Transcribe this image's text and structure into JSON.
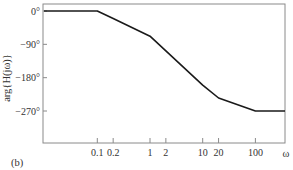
{
  "chart_data": {
    "type": "line",
    "title": "",
    "panel_label": "(b)",
    "xlabel": "ω",
    "ylabel": "arg{H(jω)}",
    "xscale": "log",
    "xlim": [
      0.0095,
      370
    ],
    "ylim": [
      -340,
      18
    ],
    "grid": false,
    "legend": null,
    "x_ticks": [
      {
        "value": 0.1,
        "label": "0.1"
      },
      {
        "value": 0.2,
        "label": "0.2"
      },
      {
        "value": 1,
        "label": "1"
      },
      {
        "value": 2,
        "label": "2"
      },
      {
        "value": 10,
        "label": "10"
      },
      {
        "value": 20,
        "label": "20"
      },
      {
        "value": 100,
        "label": "100"
      }
    ],
    "y_ticks": [
      {
        "value": 0,
        "label": "0°"
      },
      {
        "value": -90,
        "label": "−90°"
      },
      {
        "value": -180,
        "label": "−180°"
      },
      {
        "value": -270,
        "label": "−270°"
      }
    ],
    "series": [
      {
        "name": "phase",
        "color": "#1a1a1a",
        "x": [
          0.0095,
          0.1,
          0.2,
          1,
          10,
          20,
          100,
          370
        ],
        "y": [
          0,
          0,
          -20,
          -68,
          -200,
          -235,
          -270,
          -270
        ]
      }
    ]
  },
  "layout": {
    "frame": {
      "left": 43,
      "top": 4,
      "right": 285,
      "bottom": 143
    },
    "x_px_per_decade": 52.7,
    "x_ref_px": 150,
    "y_zero_px": 11,
    "y_px_per_deg": 0.3704,
    "axis_color": "#8a8a8a",
    "line_color": "#1a1a1a"
  }
}
